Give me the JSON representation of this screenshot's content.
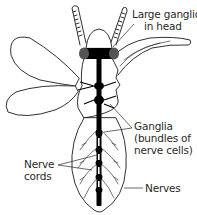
{
  "diagram": {
    "labels": {
      "large_ganglion": [
        "Large ganglion",
        "in head"
      ],
      "ganglia": [
        "Ganglia",
        "(bundles of",
        "nerve cells)"
      ],
      "nerve_cords": [
        "Nerve",
        "cords"
      ],
      "nerves": "Nerves"
    },
    "colors": {
      "line": "#1a1a1a",
      "nerve": "#000000",
      "background": "#ffffff"
    }
  }
}
